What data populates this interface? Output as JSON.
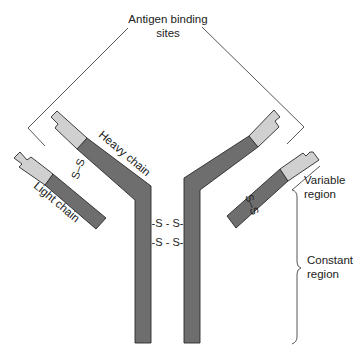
{
  "diagram": {
    "labels": {
      "antigen_binding_line1": "Antigen binding",
      "antigen_binding_line2": "sites",
      "heavy_chain": "Heavy chain",
      "light_chain": "Light chain",
      "variable_line1": "Variable",
      "variable_line2": "region",
      "constant_line1": "Constant",
      "constant_line2": "region"
    },
    "disulfide_bonds": {
      "left_arm": "S–S",
      "right_arm": "S–S",
      "hinge_1": "-S - S-",
      "hinge_2": "-S - S-"
    },
    "colors": {
      "constant_region": "#6e6e6e",
      "variable_region": "#d0d0d0",
      "outline": "#2a2a2a",
      "text": "#222222"
    }
  }
}
